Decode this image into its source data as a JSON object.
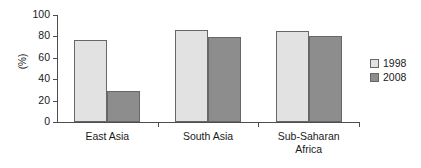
{
  "chart_data": {
    "type": "bar",
    "title": "",
    "subtitle": "",
    "xlabel": "",
    "ylabel": "(%)",
    "ylim": [
      0,
      100
    ],
    "yticks": [
      0,
      20,
      40,
      60,
      80,
      100
    ],
    "ytick_labels": [
      "0",
      "20",
      "40",
      "60",
      "80",
      "100"
    ],
    "grid": false,
    "legend_position": "right",
    "categories": [
      "East Asia",
      "South Asia",
      "Sub-Saharan\nAfrica"
    ],
    "series": [
      {
        "name": "1998",
        "color": "#e2e2e2",
        "values": [
          77,
          86,
          85
        ]
      },
      {
        "name": "2008",
        "color": "#8d8d8d",
        "values": [
          29,
          79,
          80
        ]
      }
    ]
  },
  "legend": {
    "items": [
      {
        "label": "1998"
      },
      {
        "label": "2008"
      }
    ]
  },
  "axis": {
    "y_title": "(%)"
  }
}
